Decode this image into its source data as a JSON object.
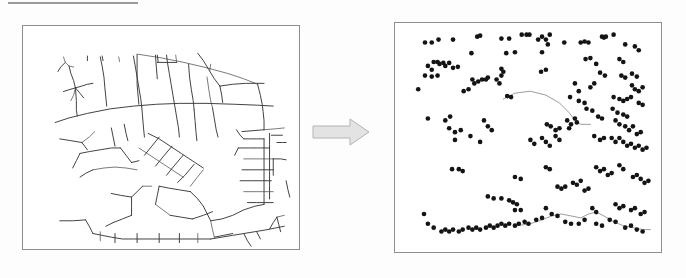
{
  "figure": {
    "rule_label": "section-rule",
    "arrow_label": "transformation arrow",
    "arrow_color": "#c9c9c9",
    "panel_border_color": "#8e8e8e",
    "road_color": "#3b3b3b",
    "dot_color": "#141414",
    "trace_color": "#8d8d8d"
  },
  "left_panel": {
    "name": "road-network-map",
    "caption": "",
    "frame": {
      "x": 22,
      "y": 25,
      "width": 278,
      "height": 225
    },
    "roads": [
      "M 44 34 L 46 40 L 50 44 L 55 45",
      "M 46 40 L 41 45 L 38 50",
      "M 50 44 L 52 52 L 55 60 L 57 68",
      "M 57 68 L 50 70 L 44 72",
      "M 57 68 L 64 66 L 70 64 L 76 63",
      "M 57 68 L 55 76 L 52 82",
      "M 57 68 L 62 74 L 66 79",
      "M 57 68 L 58 82 L 58 92 L 59 99",
      "M 70 33 L 70 38",
      "M 86 33 L 87 38",
      "M 104 34 L 105 39",
      "M 84 34 L 86 44 L 88 56 L 89 68 L 90 78 L 91 88",
      "M 35 106 L 50 101 L 70 96 L 95 91 L 120 88 L 145 86 L 170 85 L 200 85 L 230 86 L 255 87 L 272 88",
      "M 120 33 L 122 44 L 124 56 L 126 68 L 128 80 L 129 88",
      "M 129 88 L 130 100 L 131 112 L 132 122",
      "M 125 31 L 150 35 L 175 40 L 200 46 L 222 52 L 240 58 L 255 64",
      "M 124 31 L 124 48 L 124 64 L 125 76 L 126 86",
      "M 144 32 L 145 46 L 146 58",
      "M 146 32 L 147 40",
      "M 156 32 L 157 40",
      "M 166 32 L 167 40",
      "M 146 40 L 157 40 L 167 40",
      "M 157 40 L 159 52 L 161 64 L 163 76 L 165 88 L 167 100 L 169 112 L 170 122",
      "M 180 42 L 181 56 L 183 70 L 185 82 L 186 92",
      "M 186 92 L 187 104 L 188 116 L 189 126",
      "M 200 56 L 202 70 L 204 82 L 206 90",
      "M 206 90 L 208 102 L 210 114 L 212 122",
      "M 190 30 L 196 38 L 202 48 L 208 58 L 214 66",
      "M 214 66 L 228 64 L 242 63 L 254 63 L 262 63",
      "M 214 66 L 216 76 L 217 84",
      "M 203 49 L 204 42",
      "M 255 64 L 258 76 L 260 86 L 261 94 L 262 104 L 262 114",
      "M 262 114 L 250 115 L 238 116",
      "M 232 114 L 236 120 L 240 124",
      "M 240 124 L 246 124 L 254 124 L 262 124",
      "M 262 114 L 274 113 L 284 112",
      "M 262 124 L 262 136 L 262 148 L 262 160 L 262 172 L 262 184 L 262 196",
      "M 268 118 L 268 130 L 268 145 L 268 160 L 268 175 L 268 190",
      "M 234 134 L 246 134 L 258 134 L 268 134",
      "M 234 134 L 230 142",
      "M 240 146 L 252 146 L 262 146 L 272 146",
      "M 272 146 L 280 146 L 286 147",
      "M 272 146 L 272 156 L 272 164",
      "M 238 158 L 250 158 L 262 158 L 272 158",
      "M 236 170 L 248 170 L 260 170 L 270 170",
      "M 240 182 L 252 182 L 262 182 L 272 182",
      "M 244 194 L 254 194 L 262 194 L 272 194",
      "M 276 128 L 282 128 L 286 128",
      "M 270 120 L 282 120",
      "M 136 118 L 148 124 L 160 132 L 172 140 L 184 148 L 196 156",
      "M 126 134 L 138 142 L 150 150 L 162 158 L 174 166",
      "M 148 122 L 140 132 L 132 142",
      "M 162 132 L 152 144 L 144 154",
      "M 174 142 L 164 154 L 156 164",
      "M 186 152 L 176 164 L 168 172",
      "M 196 158 L 188 168 L 182 176",
      "M 62 140 L 72 138 L 84 136 L 96 134 L 106 134",
      "M 106 134 L 112 142 L 118 150",
      "M 118 150 L 126 148",
      "M 62 140 L 58 148 L 54 156",
      "M 76 158 L 88 156 L 100 155 L 112 156 L 124 158",
      "M 76 158 L 68 162 L 62 166",
      "M 96 112 L 98 122 L 100 132",
      "M 110 108 L 112 118 L 114 126",
      "M 40 124 L 52 126 L 64 128",
      "M 64 128 L 72 122 L 78 116",
      "M 64 128 L 70 136",
      "M 148 176 L 158 178 L 170 180 L 182 182",
      "M 182 182 L 190 190 L 196 198",
      "M 148 176 L 146 186 L 144 196",
      "M 144 196 L 152 202 L 160 208",
      "M 160 208 L 172 210 L 184 212",
      "M 184 212 L 196 208 L 206 204",
      "M 196 198 L 200 206 L 204 214",
      "M 204 214 L 216 212 L 228 208 L 240 202 L 252 198 L 262 196",
      "M 204 214 L 206 224 L 208 232",
      "M 208 232 L 218 230 L 228 228",
      "M 40 214 L 54 214 L 68 213",
      "M 68 213 L 72 220 L 76 228",
      "M 76 228 L 86 230 L 96 232 L 108 234 L 120 234 L 134 234 L 148 234 L 162 234 L 176 234 L 190 234 L 204 234",
      "M 84 226 L 84 236",
      "M 100 228 L 100 238",
      "M 124 228 L 124 238",
      "M 148 228 L 148 238",
      "M 170 228 L 170 238",
      "M 190 228 L 190 238",
      "M 204 234 L 216 232 L 228 230 L 240 228 L 252 226 L 264 224 L 274 222 L 284 220",
      "M 240 228 L 244 236 L 248 242",
      "M 254 226 L 258 234",
      "M 268 223 L 272 216 L 276 210",
      "M 276 210 L 284 208",
      "M 276 210 L 278 218 L 280 226",
      "M 286 170 L 288 180 L 290 188",
      "M 96 184 L 106 186 L 118 188",
      "M 118 188 L 124 182 L 130 176",
      "M 130 176 L 140 176",
      "M 118 188 L 118 198 L 118 208",
      "M 118 208 L 108 212 L 98 216",
      "M 98 216 L 90 220"
    ]
  },
  "right_panel": {
    "name": "point-distribution-map",
    "caption": "",
    "frame": {
      "x": 394,
      "y": 22,
      "width": 268,
      "height": 231
    },
    "dot_radius": 2.4,
    "point_count": 196,
    "points": [
      [
        31,
        20
      ],
      [
        38,
        20
      ],
      [
        45,
        17
      ],
      [
        60,
        17
      ],
      [
        85,
        14
      ],
      [
        88,
        13
      ],
      [
        110,
        16
      ],
      [
        118,
        16
      ],
      [
        131,
        12
      ],
      [
        136,
        12
      ],
      [
        139,
        12
      ],
      [
        148,
        17
      ],
      [
        152,
        14
      ],
      [
        156,
        17
      ],
      [
        160,
        12
      ],
      [
        158,
        22
      ],
      [
        175,
        20
      ],
      [
        192,
        20
      ],
      [
        196,
        19
      ],
      [
        200,
        20
      ],
      [
        214,
        14
      ],
      [
        216,
        15
      ],
      [
        218,
        14
      ],
      [
        226,
        12
      ],
      [
        238,
        22
      ],
      [
        248,
        24
      ],
      [
        252,
        28
      ],
      [
        79,
        31
      ],
      [
        115,
        31
      ],
      [
        124,
        30
      ],
      [
        152,
        30
      ],
      [
        40,
        40
      ],
      [
        44,
        40
      ],
      [
        46,
        42
      ],
      [
        50,
        41
      ],
      [
        52,
        44
      ],
      [
        56,
        41
      ],
      [
        34,
        44
      ],
      [
        38,
        48
      ],
      [
        60,
        46
      ],
      [
        65,
        45
      ],
      [
        31,
        54
      ],
      [
        38,
        55
      ],
      [
        44,
        54
      ],
      [
        110,
        47
      ],
      [
        112,
        50
      ],
      [
        110,
        54
      ],
      [
        151,
        50
      ],
      [
        156,
        48
      ],
      [
        197,
        37
      ],
      [
        202,
        36
      ],
      [
        208,
        42
      ],
      [
        212,
        51
      ],
      [
        217,
        54
      ],
      [
        232,
        37
      ],
      [
        236,
        40
      ],
      [
        245,
        52
      ],
      [
        250,
        55
      ],
      [
        80,
        58
      ],
      [
        82,
        62
      ],
      [
        86,
        60
      ],
      [
        90,
        58
      ],
      [
        94,
        58
      ],
      [
        96,
        56
      ],
      [
        76,
        68
      ],
      [
        105,
        58
      ],
      [
        108,
        62
      ],
      [
        24,
        68
      ],
      [
        71,
        70
      ],
      [
        186,
        62
      ],
      [
        190,
        70
      ],
      [
        202,
        66
      ],
      [
        206,
        62
      ],
      [
        234,
        54
      ],
      [
        238,
        56
      ],
      [
        245,
        64
      ],
      [
        248,
        68
      ],
      [
        252,
        70
      ],
      [
        256,
        66
      ],
      [
        116,
        75
      ],
      [
        120,
        76
      ],
      [
        181,
        76
      ],
      [
        190,
        80
      ],
      [
        196,
        82
      ],
      [
        226,
        76
      ],
      [
        232,
        78
      ],
      [
        236,
        80
      ],
      [
        240,
        78
      ],
      [
        244,
        76
      ],
      [
        252,
        82
      ],
      [
        256,
        84
      ],
      [
        34,
        98
      ],
      [
        52,
        100
      ],
      [
        57,
        96
      ],
      [
        92,
        100
      ],
      [
        225,
        88
      ],
      [
        230,
        92
      ],
      [
        236,
        94
      ],
      [
        240,
        96
      ],
      [
        56,
        108
      ],
      [
        62,
        112
      ],
      [
        68,
        110
      ],
      [
        78,
        116
      ],
      [
        96,
        106
      ],
      [
        100,
        110
      ],
      [
        157,
        104
      ],
      [
        161,
        106
      ],
      [
        166,
        110
      ],
      [
        170,
        108
      ],
      [
        178,
        100
      ],
      [
        182,
        104
      ],
      [
        180,
        108
      ],
      [
        186,
        98
      ],
      [
        188,
        102
      ],
      [
        198,
        88
      ],
      [
        204,
        90
      ],
      [
        210,
        96
      ],
      [
        214,
        98
      ],
      [
        228,
        100
      ],
      [
        232,
        104
      ],
      [
        238,
        106
      ],
      [
        242,
        110
      ],
      [
        246,
        106
      ],
      [
        250,
        114
      ],
      [
        254,
        112
      ],
      [
        62,
        120
      ],
      [
        88,
        122
      ],
      [
        140,
        120
      ],
      [
        144,
        124
      ],
      [
        152,
        118
      ],
      [
        156,
        122
      ],
      [
        160,
        126
      ],
      [
        166,
        116
      ],
      [
        170,
        120
      ],
      [
        206,
        116
      ],
      [
        212,
        120
      ],
      [
        216,
        118
      ],
      [
        224,
        118
      ],
      [
        228,
        122
      ],
      [
        232,
        118
      ],
      [
        236,
        122
      ],
      [
        240,
        126
      ],
      [
        244,
        124
      ],
      [
        248,
        128
      ],
      [
        252,
        126
      ],
      [
        256,
        130
      ],
      [
        260,
        128
      ],
      [
        59,
        150
      ],
      [
        66,
        150
      ],
      [
        70,
        152
      ],
      [
        124,
        158
      ],
      [
        130,
        160
      ],
      [
        156,
        148
      ],
      [
        160,
        150
      ],
      [
        168,
        168
      ],
      [
        172,
        170
      ],
      [
        176,
        168
      ],
      [
        184,
        164
      ],
      [
        188,
        166
      ],
      [
        192,
        162
      ],
      [
        196,
        172
      ],
      [
        200,
        170
      ],
      [
        208,
        148
      ],
      [
        212,
        152
      ],
      [
        216,
        150
      ],
      [
        220,
        156
      ],
      [
        224,
        154
      ],
      [
        232,
        146
      ],
      [
        236,
        150
      ],
      [
        246,
        158
      ],
      [
        250,
        156
      ],
      [
        254,
        160
      ],
      [
        258,
        164
      ],
      [
        262,
        162
      ],
      [
        96,
        178
      ],
      [
        102,
        180
      ],
      [
        110,
        180
      ],
      [
        118,
        182
      ],
      [
        122,
        184
      ],
      [
        126,
        186
      ],
      [
        124,
        192
      ],
      [
        130,
        192
      ],
      [
        156,
        190
      ],
      [
        204,
        190
      ],
      [
        208,
        194
      ],
      [
        228,
        186
      ],
      [
        232,
        190
      ],
      [
        236,
        188
      ],
      [
        244,
        192
      ],
      [
        248,
        190
      ],
      [
        254,
        196
      ],
      [
        258,
        194
      ],
      [
        30,
        196
      ],
      [
        34,
        206
      ],
      [
        40,
        210
      ],
      [
        48,
        214
      ],
      [
        52,
        212
      ],
      [
        56,
        214
      ],
      [
        60,
        212
      ],
      [
        66,
        214
      ],
      [
        70,
        212
      ],
      [
        76,
        210
      ],
      [
        80,
        212
      ],
      [
        84,
        210
      ],
      [
        88,
        212
      ],
      [
        94,
        210
      ],
      [
        98,
        208
      ],
      [
        102,
        210
      ],
      [
        106,
        208
      ],
      [
        110,
        206
      ],
      [
        114,
        208
      ],
      [
        118,
        206
      ],
      [
        124,
        208
      ],
      [
        128,
        206
      ],
      [
        134,
        204
      ],
      [
        138,
        206
      ],
      [
        146,
        202
      ],
      [
        152,
        200
      ],
      [
        162,
        196
      ],
      [
        168,
        198
      ],
      [
        176,
        204
      ],
      [
        182,
        206
      ],
      [
        190,
        206
      ],
      [
        196,
        202
      ],
      [
        208,
        206
      ],
      [
        214,
        208
      ],
      [
        222,
        202
      ],
      [
        228,
        204
      ],
      [
        238,
        210
      ],
      [
        244,
        208
      ],
      [
        250,
        212
      ],
      [
        256,
        214
      ]
    ],
    "traces": [
      "M 112 78 L 124 72 L 140 70 L 156 74 L 170 82 L 180 92 L 186 100 L 192 104 L 202 104",
      "M 126 208 L 140 206 L 152 202 L 162 198 L 172 196 L 182 198 L 192 200 L 200 196 L 208 194 L 216 198 L 226 204 L 236 208 L 246 210 L 256 212 L 264 212"
    ]
  }
}
